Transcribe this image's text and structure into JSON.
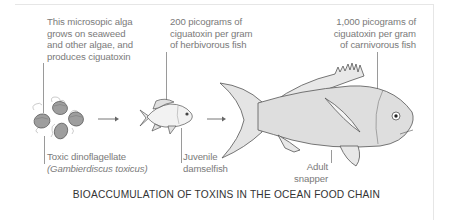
{
  "diagram": {
    "title": "BIOACCUMULATION OF TOXINS IN THE OCEAN FOOD CHAIN",
    "stages": [
      {
        "id": "alga",
        "name_line1": "Toxic dinoflagellate",
        "name_line2": "(Gambierdiscus toxicus)",
        "description": [
          "This microsopic alga",
          "grows on seaweed",
          "and other algae, and",
          "produces ciguatoxin"
        ],
        "icon": "dinoflagellate-cells-icon"
      },
      {
        "id": "damselfish",
        "name_line1": "Juvenile",
        "name_line2": "damselfish",
        "description": [
          "200 picograms of",
          "ciguatoxin per gram",
          "of herbivorous fish"
        ],
        "icon": "damselfish-icon"
      },
      {
        "id": "snapper",
        "name_line1": "Adult",
        "name_line2": "snapper",
        "description": [
          "1,000 picograms of",
          "ciguatoxin per gram",
          "of carnivorous fish"
        ],
        "icon": "snapper-icon"
      }
    ],
    "arrows": [
      "arrow-right-icon",
      "arrow-right-icon"
    ],
    "colors": {
      "text": "#7a7a7a",
      "title": "#333333",
      "outline": "#555555",
      "fill_light": "#d9d9d9",
      "fill_cell": "#9e9e9e",
      "frame": "#e6e6e6"
    }
  }
}
